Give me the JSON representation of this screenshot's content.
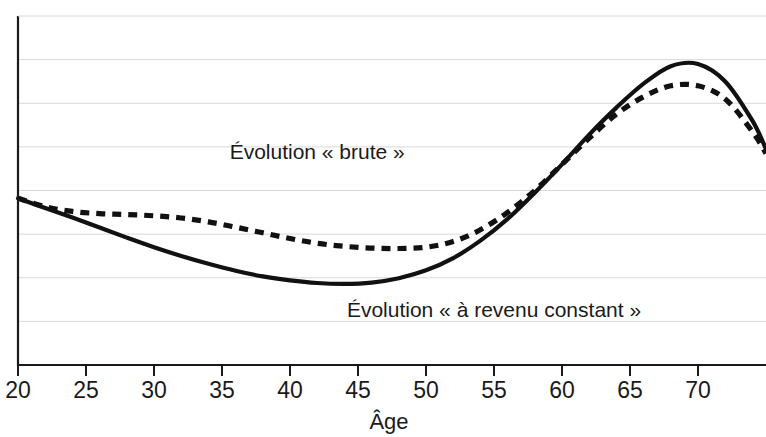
{
  "chart_data": {
    "type": "line",
    "title": "",
    "subtitle": "",
    "xlabel": "Âge",
    "ylabel": "",
    "xlim": [
      20,
      75
    ],
    "ylim": [
      0,
      8
    ],
    "grid": true,
    "grid_axis": "y",
    "gridline_count": 8,
    "legend_position": "inline-annotations",
    "x_ticks": [
      20,
      25,
      30,
      35,
      40,
      45,
      50,
      55,
      60,
      65,
      70
    ],
    "x_tick_labels": [
      "20",
      "25",
      "30",
      "35",
      "40",
      "45",
      "50",
      "55",
      "60",
      "65",
      "70"
    ],
    "y_ticks": [],
    "y_tick_labels": [],
    "series": [
      {
        "name": "Évolution « brute »",
        "style": "dashed",
        "color": "#111111",
        "x": [
          20,
          22,
          24,
          26,
          28,
          30,
          32,
          34,
          36,
          38,
          40,
          42,
          44,
          46,
          48,
          50,
          52,
          54,
          56,
          58,
          60,
          62,
          64,
          66,
          68,
          70,
          72,
          74,
          75
        ],
        "y": [
          3.82,
          3.63,
          3.52,
          3.47,
          3.45,
          3.42,
          3.37,
          3.28,
          3.16,
          3.03,
          2.9,
          2.79,
          2.72,
          2.68,
          2.67,
          2.7,
          2.83,
          3.1,
          3.5,
          4.0,
          4.6,
          5.2,
          5.75,
          6.15,
          6.4,
          6.4,
          6.1,
          5.35,
          4.85
        ]
      },
      {
        "name": "Évolution « à revenu constant »",
        "style": "solid",
        "color": "#111111",
        "x": [
          20,
          22,
          24,
          26,
          28,
          30,
          32,
          34,
          36,
          38,
          40,
          42,
          44,
          46,
          48,
          50,
          52,
          54,
          56,
          58,
          60,
          62,
          64,
          66,
          68,
          70,
          72,
          74,
          75
        ],
        "y": [
          3.82,
          3.6,
          3.38,
          3.15,
          2.92,
          2.7,
          2.5,
          2.32,
          2.16,
          2.03,
          1.94,
          1.88,
          1.86,
          1.89,
          1.99,
          2.17,
          2.45,
          2.85,
          3.35,
          3.95,
          4.6,
          5.28,
          5.9,
          6.45,
          6.85,
          6.9,
          6.5,
          5.6,
          4.95
        ]
      }
    ],
    "annotations": [
      {
        "text": "Évolution « brute »",
        "x": 42,
        "y": 4.72,
        "for_series": "Évolution « brute »"
      },
      {
        "text": "Évolution « à revenu constant »",
        "x": 55,
        "y": 1.1,
        "for_series": "Évolution « à revenu constant »"
      }
    ]
  },
  "axes": {
    "x_title": "Âge"
  },
  "colors": {
    "curve": "#111111",
    "gridline": "#d8d8d8",
    "axis": "#1a1a1a",
    "background": "#ffffff"
  }
}
